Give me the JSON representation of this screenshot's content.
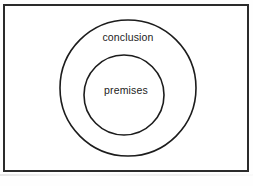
{
  "figure": {
    "type": "euler-diagram",
    "background_color": "#ffffff",
    "stroke_color": "#1c1c1c",
    "frame": {
      "border_color": "#2b2b2b",
      "border_width": 2,
      "x": 3,
      "y": 4,
      "width": 246,
      "height": 168
    },
    "shapes": [
      {
        "name": "outer-circle",
        "label": "conclusion",
        "cx": 128,
        "cy": 88,
        "r": 68,
        "fill": "none",
        "stroke": "#1c1c1c",
        "stroke_width": 1.6
      },
      {
        "name": "inner-circle",
        "label": "premises",
        "cx": 124,
        "cy": 95,
        "r": 40,
        "fill": "none",
        "stroke": "#1c1c1c",
        "stroke_width": 1.6
      }
    ],
    "labels": {
      "outer": "conclusion",
      "inner": "premises"
    },
    "caption": {
      "visible": false,
      "clipped_text": ""
    }
  }
}
